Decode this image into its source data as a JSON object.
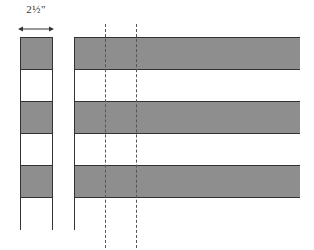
{
  "diagram": {
    "dimension_label": "2½\"",
    "colors": {
      "fabric": "#8e8e8e",
      "background": "#ffffff",
      "outline": "#333333",
      "cut_line": "#555555"
    },
    "left_column": {
      "squares": [
        "gray",
        "white",
        "gray",
        "white",
        "gray",
        "white"
      ]
    },
    "right_panel": {
      "strips": [
        "gray",
        "white",
        "gray",
        "white",
        "gray",
        "white"
      ]
    },
    "cut_lines": [
      {
        "x": 105
      },
      {
        "x": 136
      }
    ]
  }
}
